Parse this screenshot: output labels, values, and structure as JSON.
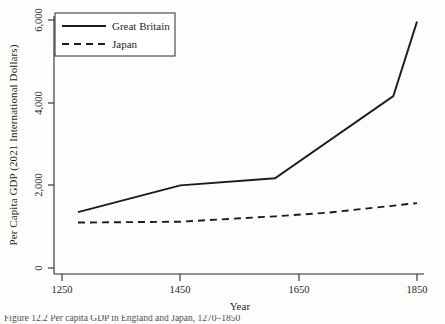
{
  "figure": {
    "background_color": "#fdfdfc",
    "ink_color": "#1c1c1c"
  },
  "axes": {
    "x_title": "Year",
    "y_title": "Per Capita GDP (2021 International Dollars)",
    "x_ticks": [
      "1250",
      "1450",
      "1650",
      "1850"
    ],
    "y_ticks": [
      "0",
      "2,000",
      "4,000",
      "6,000"
    ]
  },
  "legend": {
    "entries": [
      {
        "label": "Great Britain",
        "style": "solid"
      },
      {
        "label": "Japan",
        "style": "dashed"
      }
    ]
  },
  "caption": {
    "text": "Figure 12.2 Per capita GDP in England and Japan, 1270–1850"
  },
  "chart_data": {
    "type": "line",
    "title": "",
    "xlabel": "Year",
    "ylabel": "Per Capita GDP (2021 International Dollars)",
    "xlim": [
      1250,
      1850
    ],
    "ylim": [
      0,
      6000
    ],
    "xticks": [
      1250,
      1450,
      1650,
      1850
    ],
    "yticks": [
      0,
      2000,
      4000,
      6000
    ],
    "grid": false,
    "legend_position": "upper-left",
    "series": [
      {
        "name": "Great Britain",
        "style": "solid",
        "x": [
          1277,
          1450,
          1610,
          1810,
          1850
        ],
        "values": [
          1350,
          2000,
          2170,
          4160,
          5960
        ]
      },
      {
        "name": "Japan",
        "style": "dashed",
        "x": [
          1277,
          1450,
          1610,
          1700,
          1850
        ],
        "values": [
          1100,
          1120,
          1250,
          1340,
          1570
        ]
      }
    ]
  }
}
